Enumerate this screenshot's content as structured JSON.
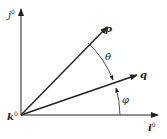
{
  "diagram": {
    "axes": {
      "vertical_label": "j",
      "vertical_sup": "0",
      "horizontal_label": "i",
      "horizontal_sup": "0",
      "origin_label": "k",
      "origin_sup": "0"
    },
    "vectors": [
      {
        "name": "p",
        "label": "p"
      },
      {
        "name": "q",
        "label": "q"
      }
    ],
    "angles": [
      {
        "name": "theta",
        "label": "θ",
        "between": [
          "p",
          "q"
        ]
      },
      {
        "name": "phi",
        "label": "φ",
        "between": [
          "q",
          "i0"
        ]
      }
    ],
    "colors": {
      "stroke": "#222222",
      "background": "#ffffff"
    }
  }
}
